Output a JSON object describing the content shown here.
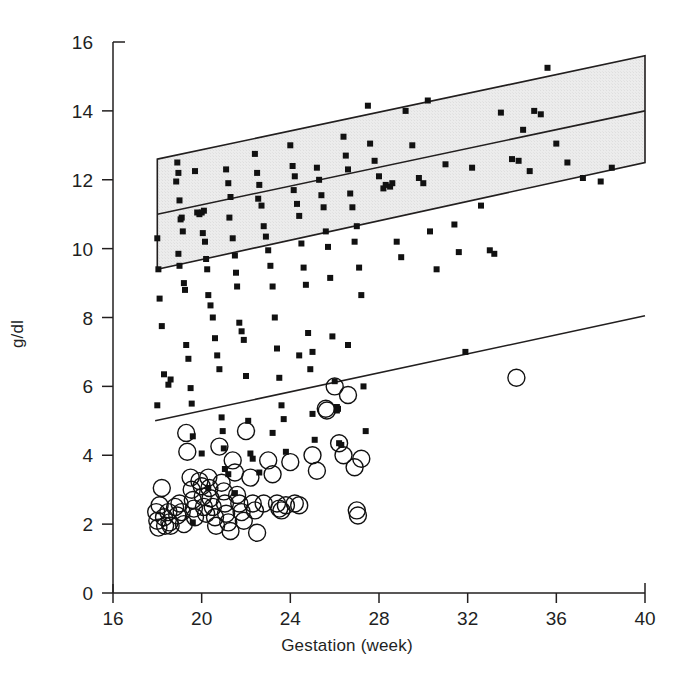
{
  "chart_data": {
    "type": "scatter",
    "title": "",
    "xlabel": "Gestation (week)",
    "ylabel": "g/dl",
    "xlim": [
      16,
      40
    ],
    "ylim": [
      0,
      16
    ],
    "xticks": [
      16,
      20,
      24,
      28,
      32,
      36,
      40
    ],
    "yticks": [
      0,
      2,
      4,
      6,
      8,
      10,
      12,
      14,
      16
    ],
    "grid": false,
    "legend": null,
    "axis_color": "#221f1f",
    "band": {
      "name": "reference-range-band",
      "fill": "#e9e9e9",
      "stroke": "#221f1f",
      "x_start": 18.0,
      "x_end": 40.0,
      "upper_start": 12.6,
      "upper_end": 15.6,
      "center_start": 11.0,
      "center_end": 14.0,
      "lower_start": 9.4,
      "lower_end": 12.5
    },
    "regression_line": {
      "name": "lower-regression-line",
      "stroke": "#221f1f",
      "x_start": 17.9,
      "y_start": 5.0,
      "x_end": 40.0,
      "y_end": 8.05
    },
    "series": [
      {
        "name": "Filled squares",
        "marker": "square",
        "color": "#111111",
        "size": 6,
        "points": [
          [
            18.0,
            10.3
          ],
          [
            18.05,
            9.4
          ],
          [
            18.1,
            8.55
          ],
          [
            18.2,
            7.75
          ],
          [
            18.0,
            5.45
          ],
          [
            18.3,
            6.35
          ],
          [
            18.5,
            6.05
          ],
          [
            18.6,
            6.2
          ],
          [
            18.9,
            12.5
          ],
          [
            18.95,
            12.2
          ],
          [
            18.85,
            11.95
          ],
          [
            19.0,
            11.4
          ],
          [
            19.05,
            10.85
          ],
          [
            19.1,
            10.9
          ],
          [
            19.15,
            10.5
          ],
          [
            18.95,
            9.85
          ],
          [
            19.0,
            9.5
          ],
          [
            19.2,
            9.0
          ],
          [
            19.25,
            8.8
          ],
          [
            19.3,
            7.2
          ],
          [
            19.4,
            6.8
          ],
          [
            19.5,
            5.95
          ],
          [
            19.55,
            5.5
          ],
          [
            19.6,
            4.55
          ],
          [
            19.7,
            12.25
          ],
          [
            19.8,
            11.05
          ],
          [
            19.9,
            11.0
          ],
          [
            20.0,
            11.05
          ],
          [
            20.1,
            11.1
          ],
          [
            20.05,
            10.45
          ],
          [
            20.15,
            10.2
          ],
          [
            20.2,
            9.7
          ],
          [
            20.25,
            9.4
          ],
          [
            20.3,
            8.65
          ],
          [
            20.4,
            8.35
          ],
          [
            20.5,
            8.0
          ],
          [
            20.6,
            7.4
          ],
          [
            20.7,
            6.9
          ],
          [
            20.8,
            6.5
          ],
          [
            20.9,
            5.1
          ],
          [
            20.95,
            4.7
          ],
          [
            21.0,
            4.2
          ],
          [
            21.05,
            3.6
          ],
          [
            21.1,
            12.3
          ],
          [
            21.2,
            11.9
          ],
          [
            21.3,
            11.5
          ],
          [
            21.25,
            10.9
          ],
          [
            21.4,
            10.3
          ],
          [
            21.5,
            9.8
          ],
          [
            21.55,
            9.3
          ],
          [
            21.6,
            8.9
          ],
          [
            21.7,
            7.85
          ],
          [
            21.8,
            7.6
          ],
          [
            21.9,
            7.35
          ],
          [
            22.0,
            6.3
          ],
          [
            22.1,
            5.0
          ],
          [
            22.2,
            4.05
          ],
          [
            22.3,
            3.9
          ],
          [
            22.4,
            12.75
          ],
          [
            22.5,
            12.2
          ],
          [
            22.6,
            11.85
          ],
          [
            22.55,
            11.45
          ],
          [
            22.7,
            11.25
          ],
          [
            22.8,
            10.65
          ],
          [
            22.9,
            10.35
          ],
          [
            23.0,
            9.95
          ],
          [
            23.1,
            9.5
          ],
          [
            23.2,
            8.9
          ],
          [
            23.3,
            8.0
          ],
          [
            23.4,
            7.1
          ],
          [
            23.5,
            6.25
          ],
          [
            23.6,
            5.45
          ],
          [
            23.7,
            5.05
          ],
          [
            23.8,
            4.1
          ],
          [
            24.0,
            13.0
          ],
          [
            24.1,
            12.4
          ],
          [
            24.2,
            12.1
          ],
          [
            24.15,
            11.7
          ],
          [
            24.3,
            11.3
          ],
          [
            24.4,
            10.95
          ],
          [
            24.5,
            10.15
          ],
          [
            24.6,
            9.45
          ],
          [
            24.7,
            8.95
          ],
          [
            24.8,
            7.55
          ],
          [
            24.9,
            6.5
          ],
          [
            25.0,
            5.2
          ],
          [
            25.1,
            4.45
          ],
          [
            25.2,
            12.35
          ],
          [
            25.3,
            12.0
          ],
          [
            25.4,
            11.55
          ],
          [
            25.5,
            11.2
          ],
          [
            25.6,
            10.5
          ],
          [
            25.7,
            10.05
          ],
          [
            25.8,
            9.15
          ],
          [
            25.9,
            7.45
          ],
          [
            26.0,
            6.15
          ],
          [
            26.1,
            5.4
          ],
          [
            26.15,
            5.35
          ],
          [
            26.2,
            4.35
          ],
          [
            26.3,
            4.3
          ],
          [
            26.4,
            13.25
          ],
          [
            26.5,
            12.7
          ],
          [
            26.6,
            12.3
          ],
          [
            26.7,
            11.6
          ],
          [
            26.8,
            11.2
          ],
          [
            26.9,
            10.2
          ],
          [
            27.0,
            10.65
          ],
          [
            27.1,
            9.45
          ],
          [
            27.2,
            8.65
          ],
          [
            27.3,
            6.0
          ],
          [
            27.4,
            4.7
          ],
          [
            27.6,
            13.05
          ],
          [
            27.8,
            12.55
          ],
          [
            28.0,
            12.1
          ],
          [
            28.2,
            11.75
          ],
          [
            28.3,
            11.85
          ],
          [
            28.5,
            11.8
          ],
          [
            28.6,
            11.9
          ],
          [
            28.8,
            10.2
          ],
          [
            29.0,
            9.75
          ],
          [
            29.2,
            14.0
          ],
          [
            29.5,
            13.0
          ],
          [
            29.8,
            12.05
          ],
          [
            30.0,
            11.9
          ],
          [
            30.3,
            10.5
          ],
          [
            30.6,
            9.4
          ],
          [
            31.0,
            12.45
          ],
          [
            31.4,
            10.7
          ],
          [
            31.6,
            9.9
          ],
          [
            31.9,
            7.0
          ],
          [
            32.2,
            12.35
          ],
          [
            32.6,
            11.25
          ],
          [
            33.0,
            9.95
          ],
          [
            33.2,
            9.85
          ],
          [
            33.5,
            13.95
          ],
          [
            34.0,
            12.6
          ],
          [
            34.3,
            12.55
          ],
          [
            34.5,
            13.45
          ],
          [
            34.8,
            12.25
          ],
          [
            35.0,
            14.0
          ],
          [
            35.3,
            13.9
          ],
          [
            35.6,
            15.25
          ],
          [
            36.0,
            13.05
          ],
          [
            36.5,
            12.5
          ],
          [
            37.2,
            12.05
          ],
          [
            38.0,
            11.95
          ],
          [
            38.5,
            12.35
          ],
          [
            30.2,
            14.3
          ],
          [
            27.5,
            14.15
          ],
          [
            26.6,
            7.2
          ],
          [
            25.0,
            7.0
          ],
          [
            24.4,
            6.9
          ],
          [
            23.2,
            4.65
          ],
          [
            22.6,
            3.5
          ],
          [
            21.2,
            3.45
          ],
          [
            20.3,
            3.05
          ],
          [
            19.6,
            2.05
          ],
          [
            20.0,
            4.05
          ],
          [
            21.5,
            2.9
          ],
          [
            26.1,
            5.3
          ]
        ]
      },
      {
        "name": "Open circles",
        "marker": "circle",
        "color": "#111111",
        "size": 17,
        "points": [
          [
            17.95,
            2.35
          ],
          [
            18.0,
            2.1
          ],
          [
            18.05,
            1.9
          ],
          [
            18.1,
            2.55
          ],
          [
            18.3,
            2.2
          ],
          [
            18.35,
            1.95
          ],
          [
            18.5,
            2.35
          ],
          [
            18.55,
            2.05
          ],
          [
            18.2,
            3.05
          ],
          [
            18.8,
            2.5
          ],
          [
            18.9,
            2.25
          ],
          [
            19.0,
            2.6
          ],
          [
            19.1,
            2.35
          ],
          [
            19.3,
            4.65
          ],
          [
            19.35,
            4.1
          ],
          [
            19.5,
            3.35
          ],
          [
            19.55,
            3.0
          ],
          [
            19.6,
            2.7
          ],
          [
            19.65,
            2.45
          ],
          [
            19.7,
            2.2
          ],
          [
            19.9,
            3.25
          ],
          [
            20.0,
            3.1
          ],
          [
            20.05,
            2.8
          ],
          [
            20.1,
            2.5
          ],
          [
            20.2,
            2.3
          ],
          [
            20.3,
            3.35
          ],
          [
            20.35,
            3.05
          ],
          [
            20.4,
            2.75
          ],
          [
            20.5,
            2.5
          ],
          [
            20.6,
            2.2
          ],
          [
            20.65,
            1.95
          ],
          [
            20.8,
            4.25
          ],
          [
            20.9,
            3.2
          ],
          [
            21.0,
            2.95
          ],
          [
            21.05,
            2.6
          ],
          [
            21.1,
            2.3
          ],
          [
            21.2,
            2.05
          ],
          [
            21.3,
            1.8
          ],
          [
            21.4,
            3.85
          ],
          [
            21.5,
            3.5
          ],
          [
            21.6,
            2.85
          ],
          [
            21.7,
            2.6
          ],
          [
            21.8,
            2.35
          ],
          [
            22.0,
            4.7
          ],
          [
            22.2,
            3.35
          ],
          [
            22.3,
            2.6
          ],
          [
            22.4,
            2.4
          ],
          [
            22.5,
            1.75
          ],
          [
            22.8,
            2.6
          ],
          [
            23.0,
            3.85
          ],
          [
            23.2,
            3.45
          ],
          [
            23.4,
            2.6
          ],
          [
            23.5,
            2.45
          ],
          [
            23.6,
            2.4
          ],
          [
            24.0,
            3.8
          ],
          [
            24.2,
            2.6
          ],
          [
            24.4,
            2.55
          ],
          [
            25.0,
            4.0
          ],
          [
            25.2,
            3.55
          ],
          [
            25.6,
            5.35
          ],
          [
            25.65,
            5.3
          ],
          [
            26.0,
            6.0
          ],
          [
            26.2,
            4.35
          ],
          [
            26.4,
            4.0
          ],
          [
            26.6,
            5.75
          ],
          [
            26.9,
            3.65
          ],
          [
            27.0,
            2.4
          ],
          [
            27.05,
            2.25
          ],
          [
            27.2,
            3.9
          ],
          [
            34.2,
            6.25
          ],
          [
            19.2,
            2.0
          ],
          [
            18.6,
            1.95
          ],
          [
            21.9,
            2.1
          ],
          [
            23.8,
            2.55
          ]
        ]
      }
    ]
  },
  "figure": {
    "xlabel": "Gestation (week)",
    "ylabel": "g/dl",
    "xticklabels": [
      "16",
      "20",
      "24",
      "28",
      "32",
      "36",
      "40"
    ],
    "yticklabels": [
      "0",
      "2",
      "4",
      "6",
      "8",
      "10",
      "12",
      "14",
      "16"
    ]
  }
}
